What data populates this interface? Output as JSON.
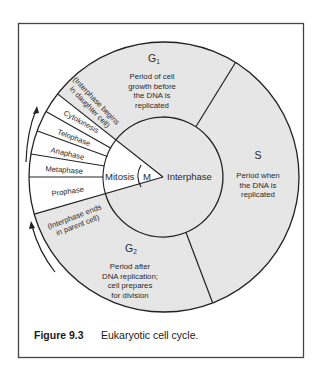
{
  "figure": {
    "caption_number": "Figure 9.3",
    "caption_text": "Eukaryotic cell cycle.",
    "colors": {
      "interphase_fill": "#e6e6e6",
      "mitosis_fill": "#ffffff",
      "stroke": "#222222",
      "frame": "#444444"
    }
  },
  "cycle": {
    "center_label": "Interphase",
    "mitosis_label": "Mitosis",
    "m_label": "M",
    "g1": {
      "label": "G",
      "subscript": "1",
      "description": [
        "Period of cell",
        "growth before",
        "the DNA is",
        "replicated"
      ]
    },
    "s": {
      "label": "S",
      "description": [
        "Period when",
        "the DNA is",
        "replicated"
      ]
    },
    "g2": {
      "label": "G",
      "subscript": "2",
      "description": [
        "Period after",
        "DNA replication;",
        "cell prepares",
        "for division"
      ]
    },
    "mitosis_phases": [
      "Cytokinesis",
      "Telophase",
      "Anaphase",
      "Metaphase",
      "Prophase"
    ],
    "interphase_begins": [
      "(Interphase begins",
      "in daughter cell)"
    ],
    "interphase_ends": [
      "(Interphase ends",
      "in parent cell)"
    ]
  }
}
